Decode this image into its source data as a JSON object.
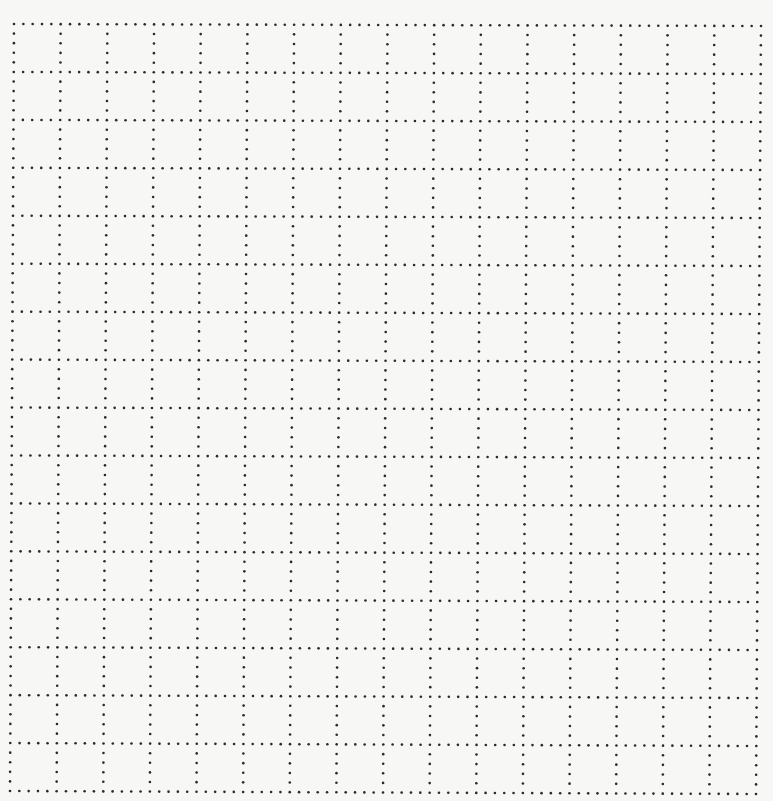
{
  "page": {
    "kind": "dotted-grid-paper",
    "background_color": "#f7f7f6",
    "dot_color": "#2a2a2a"
  },
  "grid": {
    "columns": 16,
    "rows": 16,
    "dots_per_cell_segment": 5,
    "dot_radius": 1.3,
    "corners": {
      "top_left": [
        14,
        24
      ],
      "top_right": [
        761,
        26
      ],
      "bottom_left": [
        10,
        791
      ],
      "bottom_right": [
        756,
        794
      ]
    }
  }
}
